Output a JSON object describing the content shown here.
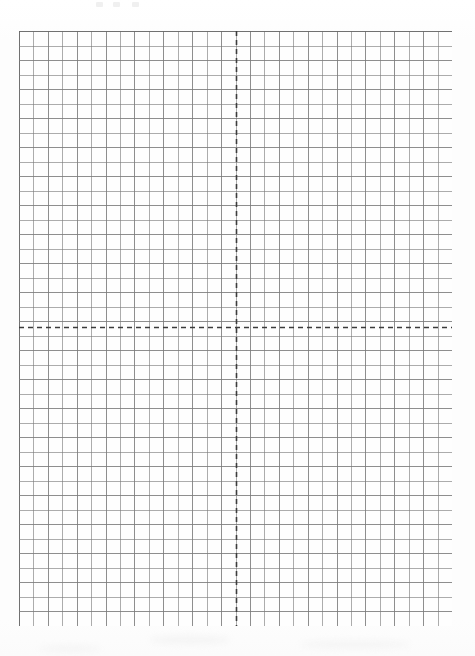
{
  "document": {
    "kind": "graph-paper-worksheet",
    "page_background": "#fdfdfd",
    "top_artifact_labels": [
      "",
      "",
      ""
    ]
  },
  "grid": {
    "x": 19,
    "y": 31,
    "width": 433,
    "height": 595,
    "columns": 30,
    "rows": 41,
    "cell_width": 14.43,
    "cell_height": 14.51,
    "line_color": "#7b7b7b",
    "line_width": 1,
    "border_color": "#6a6a6a",
    "cell_fill": "#fefefe"
  },
  "axes": {
    "color": "#3c3c3c",
    "line_width": 1.6,
    "dash_on": 5,
    "dash_off": 4,
    "origin_x": 236,
    "origin_y": 327,
    "x_axis": {
      "name": "x-axis",
      "orientation": "horizontal",
      "y_position": 296,
      "from_x": 0,
      "to_x": 433
    },
    "y_axis": {
      "name": "y-axis",
      "orientation": "vertical",
      "x_position": 217,
      "from_y": 0,
      "to_y": 595
    }
  },
  "chart_data": {
    "type": "scatter",
    "title": "",
    "xlabel": "",
    "ylabel": "",
    "series": [],
    "x": [],
    "values": [],
    "grid": true,
    "legend_position": "none",
    "xlim": [
      -15,
      15
    ],
    "ylim": [
      -21,
      20
    ],
    "x_ticks": [],
    "y_ticks": [],
    "annotations": [],
    "note": "Blank Cartesian graph paper: 30 columns by 41 rows of unit squares with dashed x- and y-axes intersecting at the origin. No plotted data."
  }
}
